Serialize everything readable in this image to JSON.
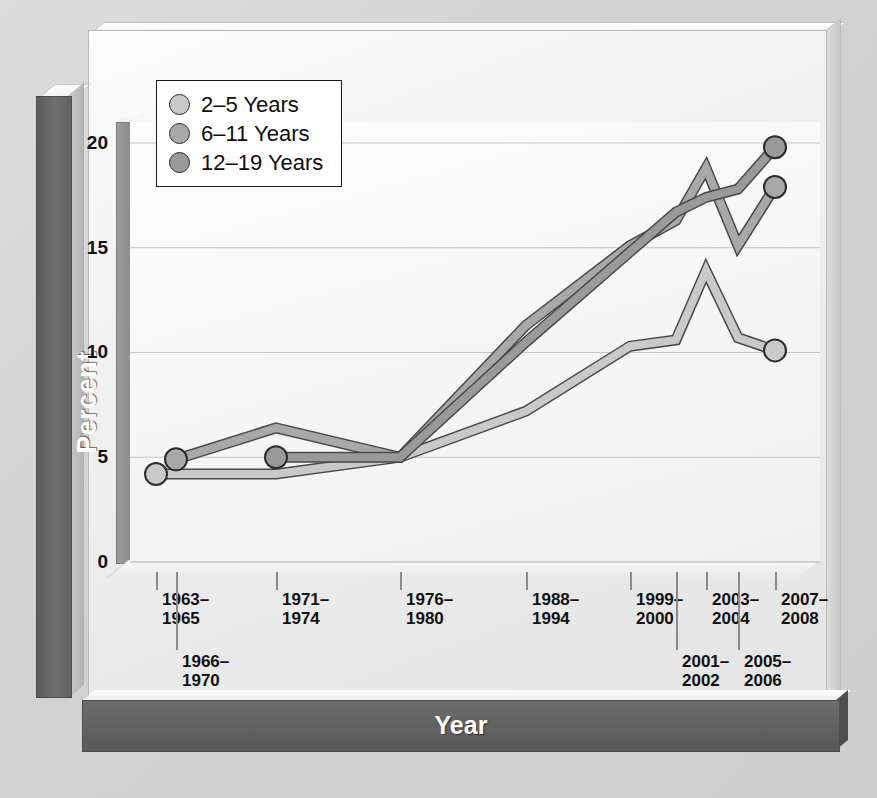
{
  "chart_data": {
    "type": "line",
    "title": "",
    "xlabel": "Year",
    "ylabel": "Percent",
    "ylim": [
      0,
      21
    ],
    "yticks": [
      0,
      5,
      10,
      15,
      20
    ],
    "grid": true,
    "legend_position": "top-left",
    "categories": [
      "1963–1965",
      "1966–1970",
      "1971–1974",
      "1976–1980",
      "1988–1994",
      "1999–2000",
      "2001–2002",
      "2003–2004",
      "2005–2006",
      "2007–2008"
    ],
    "series": [
      {
        "name": "2–5 Years",
        "color": "#c9c9c9",
        "values": [
          4.2,
          4.2,
          4.2,
          5.0,
          7.2,
          10.3,
          10.6,
          13.9,
          10.7,
          10.1
        ],
        "start_index": 0,
        "marker_indices": [
          0,
          9
        ]
      },
      {
        "name": "6–11 Years",
        "color": "#a8a8a8",
        "values": [
          null,
          4.9,
          6.4,
          5.0,
          11.3,
          15.1,
          16.3,
          18.8,
          15.1,
          17.9
        ],
        "start_index": 1,
        "marker_indices": [
          1,
          9
        ]
      },
      {
        "name": "12–19 Years",
        "color": "#9a9a9a",
        "values": [
          null,
          null,
          5.0,
          5.0,
          10.5,
          14.8,
          16.7,
          17.4,
          17.8,
          19.8
        ],
        "start_index": 2,
        "marker_indices": [
          2,
          9
        ]
      }
    ]
  },
  "axes": {
    "y_title": "Percent",
    "x_title": "Year",
    "y_tick_labels": [
      "20",
      "15",
      "10",
      "5",
      "0"
    ],
    "x_tick_labels": [
      {
        "text": "1963–\n1965",
        "row": "upper"
      },
      {
        "text": "1966–\n1970",
        "row": "lower"
      },
      {
        "text": "1971–\n1974",
        "row": "upper"
      },
      {
        "text": "1976–\n1980",
        "row": "upper"
      },
      {
        "text": "1988–\n1994",
        "row": "upper"
      },
      {
        "text": "1999–\n2000",
        "row": "upper"
      },
      {
        "text": "2001–\n2002",
        "row": "lower"
      },
      {
        "text": "2003–\n2004",
        "row": "upper"
      },
      {
        "text": "2005–\n2006",
        "row": "lower"
      },
      {
        "text": "2007–\n2008",
        "row": "upper"
      }
    ]
  },
  "legend": {
    "items": [
      {
        "label": "2–5 Years",
        "color": "#c9c9c9"
      },
      {
        "label": "6–11 Years",
        "color": "#a8a8a8"
      },
      {
        "label": "12–19 Years",
        "color": "#9a9a9a"
      }
    ]
  },
  "colors": {
    "background": "#d4d4d4",
    "panel": "#f2f2f2",
    "slab": "#636363",
    "gridline": "#c5c5c5",
    "line_stroke": "#4a4a4a",
    "text": "#111111"
  }
}
